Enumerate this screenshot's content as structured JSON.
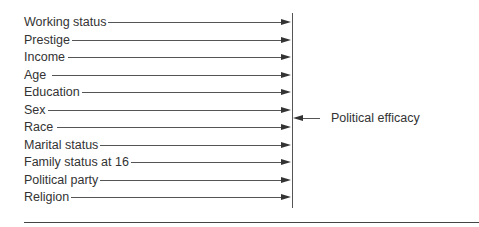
{
  "diagram": {
    "type": "path-diagram",
    "predictors": [
      {
        "label": "Working status",
        "y": 22,
        "line_start": 90
      },
      {
        "label": "Prestige",
        "y": 40,
        "line_start": 72
      },
      {
        "label": "Income",
        "y": 57,
        "line_start": 68
      },
      {
        "label": "Age",
        "y": 75,
        "line_start": 52
      },
      {
        "label": "Education",
        "y": 92,
        "line_start": 77
      },
      {
        "label": "Sex",
        "y": 110,
        "line_start": 47
      },
      {
        "label": "Race",
        "y": 127,
        "line_start": 57
      },
      {
        "label": "Marital status",
        "y": 145,
        "line_start": 99
      },
      {
        "label": "Family status at 16",
        "y": 162,
        "line_start": 128
      },
      {
        "label": "Political party",
        "y": 180,
        "line_start": 99
      },
      {
        "label": "Religion",
        "y": 197,
        "line_start": 68
      }
    ],
    "outcome": {
      "label": "Political efficacy",
      "y": 118
    },
    "colors": {
      "line": "#555555",
      "text": "#333333",
      "background": "#ffffff"
    }
  }
}
